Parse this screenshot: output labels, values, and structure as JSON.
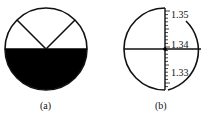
{
  "figure": {
    "panels": [
      {
        "id": "a",
        "caption": "(a)",
        "description": "Circular field of view, lower half dark, upper half bright with crosshair lines"
      },
      {
        "id": "b",
        "caption": "(b)",
        "description": "Circular field of view with crosshair and vertical refractive index scale",
        "scale": {
          "labels": [
            "1.35",
            "1.34",
            "1.33"
          ],
          "reading_at_crosshair": "1.34"
        }
      }
    ],
    "colors": {
      "stroke": "#111111",
      "fill_dark": "#000000",
      "background": "#ffffff"
    }
  }
}
